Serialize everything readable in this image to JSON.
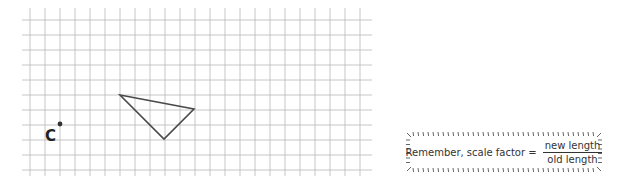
{
  "grid": {
    "x_start": 30,
    "x_end": 372,
    "y_start": 8,
    "y_end": 176,
    "spacing": 15,
    "line_color": "#b8b8b8"
  },
  "triangle": {
    "vertices": [
      {
        "x": 120,
        "y": 95
      },
      {
        "x": 194,
        "y": 109
      },
      {
        "x": 164,
        "y": 139
      }
    ],
    "stroke_color": "#4a4a4a"
  },
  "center_point": {
    "label": "C",
    "x": 60,
    "y": 124
  },
  "note": {
    "prefix": "Remember, scale factor =",
    "numerator": "new length",
    "denominator": "old length"
  }
}
